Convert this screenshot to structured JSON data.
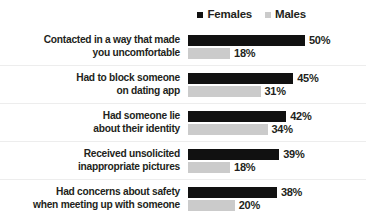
{
  "legend": {
    "items": [
      {
        "label": "Females",
        "color": "#111111",
        "swatch": "legend-square-icon"
      },
      {
        "label": "Males",
        "color": "#cbcbcb",
        "swatch": "legend-square-icon"
      }
    ]
  },
  "chart_data": {
    "type": "bar",
    "orientation": "horizontal",
    "title": "",
    "subtitle": "",
    "xlabel": "",
    "ylabel": "",
    "xlim": [
      0,
      50
    ],
    "grid": false,
    "legend_position": "top-right",
    "value_suffix": "%",
    "categories": [
      "Contacted in a way that made you uncomfortable",
      "Had to block someone on dating app",
      "Had someone lie about their identity",
      "Received unsolicited inappropriate pictures",
      "Had concerns about safety when meeting up with someone"
    ],
    "category_lines": [
      [
        "Contacted in a way that made",
        "you uncomfortable"
      ],
      [
        "Had to block someone",
        "on dating app"
      ],
      [
        "Had someone lie",
        "about their identity"
      ],
      [
        "Received unsolicited",
        "inappropriate pictures"
      ],
      [
        "Had concerns about safety",
        "when meeting up with someone"
      ]
    ],
    "series": [
      {
        "name": "Females",
        "color": "#111111",
        "values": [
          50,
          45,
          42,
          39,
          38
        ],
        "labels": [
          "50%",
          "45%",
          "42%",
          "39%",
          "38%"
        ]
      },
      {
        "name": "Males",
        "color": "#cbcbcb",
        "values": [
          18,
          31,
          34,
          18,
          20
        ],
        "labels": [
          "18%",
          "31%",
          "34%",
          "18%",
          "20%"
        ]
      }
    ]
  }
}
